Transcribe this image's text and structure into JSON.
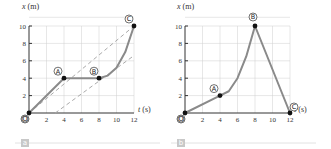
{
  "chart_data": [
    {
      "type": "line",
      "panel_label": "a",
      "xlabel": "t (s)",
      "ylabel": "x (m)",
      "xlim": [
        0,
        12
      ],
      "ylim": [
        0,
        10
      ],
      "xticks": [
        "2",
        "4",
        "6",
        "8",
        "10",
        "12"
      ],
      "yticks": [
        "2",
        "4",
        "6",
        "8",
        "10"
      ],
      "grid": true,
      "series": [
        {
          "name": "position",
          "points": [
            [
              0,
              0
            ],
            [
              4,
              4
            ],
            [
              8,
              4
            ],
            [
              9,
              4.3
            ],
            [
              10,
              5.2
            ],
            [
              11,
              7
            ],
            [
              12,
              10
            ]
          ]
        }
      ],
      "dashed_lines": [
        {
          "name": "tangent-upper",
          "points": [
            [
              0,
              0
            ],
            [
              12,
              10
            ]
          ]
        },
        {
          "name": "tangent-lower",
          "points": [
            [
              3,
              0
            ],
            [
              12,
              6.6
            ]
          ]
        }
      ],
      "labeled_points": [
        {
          "label": "O",
          "x": 0,
          "y": 0
        },
        {
          "label": "A",
          "x": 4,
          "y": 4
        },
        {
          "label": "B",
          "x": 8,
          "y": 4
        },
        {
          "label": "C",
          "x": 12,
          "y": 10
        }
      ]
    },
    {
      "type": "line",
      "panel_label": "b",
      "xlabel": "t (s)",
      "ylabel": "x (m)",
      "xlim": [
        0,
        12
      ],
      "ylim": [
        0,
        10
      ],
      "xticks": [
        "2",
        "4",
        "6",
        "8",
        "10",
        "12"
      ],
      "yticks": [
        "2",
        "4",
        "6",
        "8",
        "10"
      ],
      "grid": true,
      "series": [
        {
          "name": "position",
          "points": [
            [
              0,
              0
            ],
            [
              4,
              2
            ],
            [
              5,
              2.5
            ],
            [
              6,
              4
            ],
            [
              7,
              6.5
            ],
            [
              8,
              10
            ],
            [
              12,
              0
            ]
          ]
        }
      ],
      "dashed_lines": [],
      "labeled_points": [
        {
          "label": "O",
          "x": 0,
          "y": 0
        },
        {
          "label": "A",
          "x": 4,
          "y": 2
        },
        {
          "label": "B",
          "x": 8,
          "y": 10
        },
        {
          "label": "C",
          "x": 12,
          "y": 0
        }
      ]
    }
  ]
}
